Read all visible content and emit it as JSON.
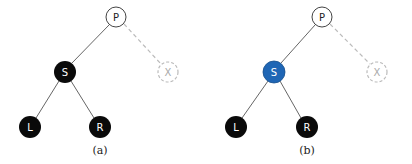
{
  "colors": {
    "black_node": "#0a0a0a",
    "white_node": "#ffffff",
    "highlight_node": "#1f66b5",
    "edge": "#666666",
    "dashed": "#bbbbbb",
    "node_stroke": "#444444"
  },
  "panels": [
    {
      "caption": "(a)",
      "nodes": {
        "P": {
          "label": "P",
          "fill": "white"
        },
        "S": {
          "label": "S",
          "fill": "black"
        },
        "X": {
          "label": "X",
          "fill": "dashed"
        },
        "L": {
          "label": "L",
          "fill": "black"
        },
        "R": {
          "label": "R",
          "fill": "black"
        }
      }
    },
    {
      "caption": "(b)",
      "nodes": {
        "P": {
          "label": "P",
          "fill": "white"
        },
        "S": {
          "label": "S",
          "fill": "blue"
        },
        "X": {
          "label": "X",
          "fill": "dashed"
        },
        "L": {
          "label": "L",
          "fill": "black"
        },
        "R": {
          "label": "R",
          "fill": "black"
        }
      }
    }
  ]
}
